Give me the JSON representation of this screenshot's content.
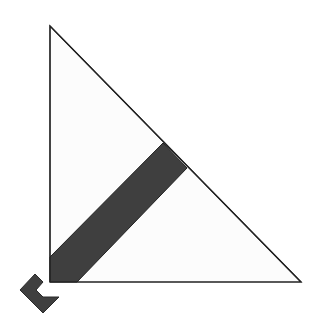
{
  "diagram": {
    "colors": {
      "background": "#ffffff",
      "triangle_fill": "#fcfcfc",
      "stroke": "#222222",
      "band_fill": "#3f3f3f",
      "arrow_fill": "#3f3f3f"
    },
    "triangle": {
      "points": "50,26 50,282 301,282"
    },
    "band": {
      "points": "50,257 163,143 187,168 77,282 50,282"
    },
    "arrow": {
      "points": "35,274 20,290 43,313 59,297 43,297 36,290 43,282"
    }
  }
}
